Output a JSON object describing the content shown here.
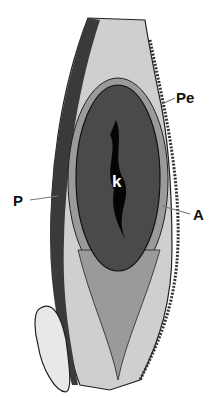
{
  "figure": {
    "type": "anatomical cross-section",
    "labels": {
      "pe": "Pe",
      "p": "P",
      "a": "A",
      "k": "k"
    },
    "colors": {
      "background": "#ffffff",
      "outer_tissue": "#c9c9c9",
      "inner_band": "#9a9a9a",
      "core": "#4a4a4a",
      "lumen": "#050505",
      "dark_strip": "#3a3a3a",
      "label": "#111111",
      "arrow": "#777777"
    }
  }
}
